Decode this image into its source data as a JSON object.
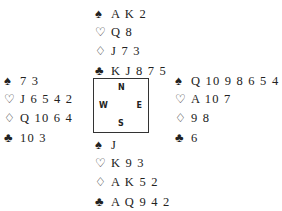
{
  "deal": {
    "north": {
      "spades": "A K 2",
      "hearts": "Q 8",
      "diamonds": "J 7 3",
      "clubs": "K J 8 7 5"
    },
    "west": {
      "spades": "7 3",
      "hearts": "J 6 5 4 2",
      "diamonds": "Q 10 6 4",
      "clubs": "10 3"
    },
    "east": {
      "spades": "Q 10 9 8 6 5 4",
      "hearts": "A 10 7",
      "diamonds": "9 8",
      "clubs": "6"
    },
    "south": {
      "spades": "J",
      "hearts": "K 9 3",
      "diamonds": "A K 5 2",
      "clubs": "A Q 9 4 2"
    }
  },
  "compass": {
    "n": "N",
    "s": "S",
    "e": "E",
    "w": "W"
  },
  "suit_symbols": {
    "spades": "♠",
    "hearts": "♡",
    "diamonds": "♢",
    "clubs": "♣"
  }
}
